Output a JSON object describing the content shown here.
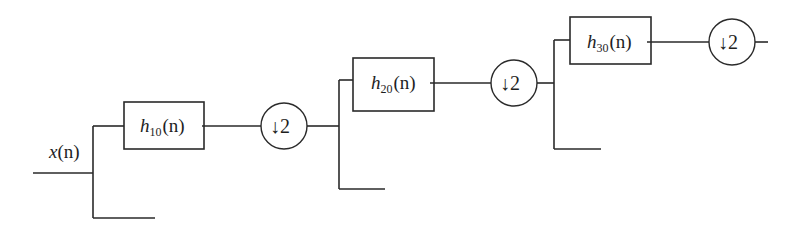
{
  "diagram": {
    "type": "three-level dyadic analysis filter bank (wavelet decomposition)",
    "input": {
      "label_main": "x",
      "label_arg": "(n)"
    },
    "stages": [
      {
        "filter": {
          "main": "h",
          "sub": "10",
          "arg": "(n)"
        },
        "downsampler": "↓2"
      },
      {
        "filter": {
          "main": "h",
          "sub": "20",
          "arg": "(n)"
        },
        "downsampler": "↓2"
      },
      {
        "filter": {
          "main": "h",
          "sub": "30",
          "arg": "(n)"
        },
        "downsampler": "↓2"
      }
    ],
    "colors": {
      "line": "#2a2a2a",
      "background": "#ffffff"
    }
  }
}
